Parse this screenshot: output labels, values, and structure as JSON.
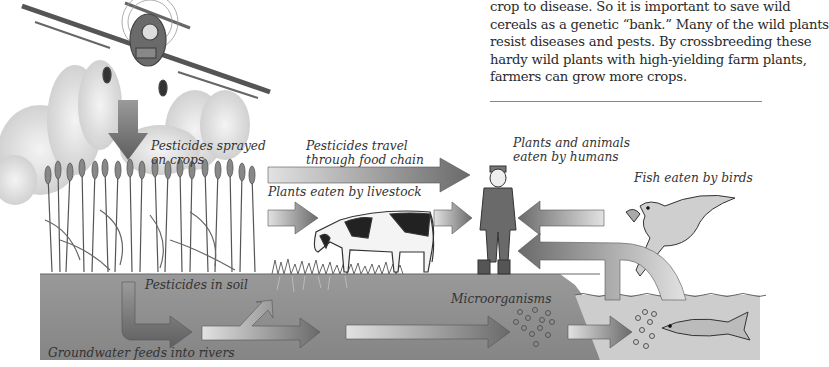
{
  "paragraph": {
    "lines": [
      "crop to disease. So it is important to save wild",
      "cereals as a genetic “bank.” Many of the wild plants",
      "resist diseases and pests. By crossbreeding these",
      "hardy wild plants with high-yielding farm plants,",
      "farmers can grow more crops."
    ]
  },
  "labels": {
    "sprayed_1": "Pesticides sprayed",
    "sprayed_2": "on crops",
    "travel_1": "Pesticides travel",
    "travel_2": "through food chain",
    "humans_1": "Plants and animals",
    "humans_2": "eaten by humans",
    "livestock": "Plants eaten by livestock",
    "birds": "Fish eaten by birds",
    "soil": "Pesticides in soil",
    "micro": "Microorganisms",
    "groundwater": "Groundwater feeds into rivers"
  },
  "illustrations": [
    "crop-duster-plane",
    "pesticide-spray-cloud",
    "wheat-crop",
    "cow",
    "farmer",
    "bird-with-fish",
    "fish",
    "microorganism-dots",
    "soil-ground",
    "river-water"
  ],
  "colors": {
    "arrow_dark": "#6f6f6f",
    "arrow_light": "#d8d8d8",
    "soil": "#8c8c8c",
    "water": "#cfcfcf"
  }
}
